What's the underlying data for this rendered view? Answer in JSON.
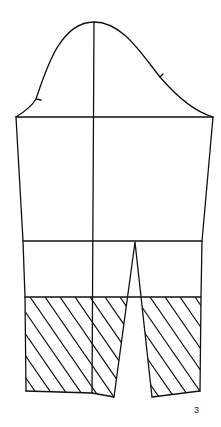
{
  "figure": {
    "label": "3",
    "label_pos": {
      "x": 194,
      "y": 405
    },
    "stroke_color": "#111111",
    "background": "#ffffff"
  },
  "pattern": {
    "title": "Sleeve pattern with elbow dart and hatched lower section",
    "sleeve_cap": {
      "path": "M16,117 C24,112 32,106 36,99 C46,70 60,22 94,22 C122,22 140,52 160,77 C178,98 196,112 213,117",
      "notches": [
        {
          "x1": 36,
          "y1": 99,
          "x2": 41,
          "y2": 100
        },
        {
          "x1": 160,
          "y1": 77,
          "x2": 163,
          "y2": 74
        }
      ]
    },
    "biceps_line": {
      "x1": 16,
      "y1": 117,
      "x2": 213,
      "y2": 117
    },
    "center_line": {
      "x1": 94,
      "y1": 22,
      "x2": 92,
      "y2": 393
    },
    "left_seam": [
      [
        16,
        117
      ],
      [
        23,
        241
      ],
      [
        25,
        297
      ],
      [
        26,
        391
      ]
    ],
    "right_seam": [
      [
        213,
        117
      ],
      [
        202,
        241
      ],
      [
        201,
        297
      ],
      [
        200,
        391
      ]
    ],
    "elbow_line": {
      "x1": 23,
      "y1": 241,
      "x2": 202,
      "y2": 241
    },
    "hatch_top_line": {
      "x1": 25,
      "y1": 297,
      "x2": 201,
      "y2": 297
    },
    "dart": {
      "apex": [
        135,
        242
      ],
      "left_bottom": [
        114,
        397
      ],
      "right_bottom": [
        152,
        397
      ]
    },
    "hem_left": [
      [
        26,
        391
      ],
      [
        92,
        393
      ],
      [
        114,
        397
      ]
    ],
    "hem_right": [
      [
        152,
        397
      ],
      [
        200,
        391
      ]
    ],
    "hatching": {
      "spacing": 15,
      "slope": 1.45,
      "regions": [
        "left-panel",
        "right-panel"
      ]
    }
  }
}
